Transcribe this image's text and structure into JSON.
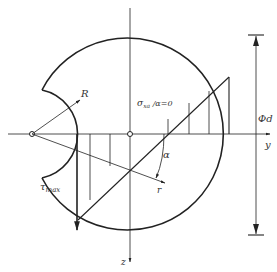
{
  "diagram": {
    "type": "stress distribution in circular cross-section with notch",
    "colors": {
      "line": "#222222",
      "text": "#333333",
      "background": "#ffffff"
    },
    "labels": {
      "R": "R",
      "sigma_label": "σ",
      "sigma_sub": "xa",
      "sigma_cond": " /α=0",
      "phi_d": "Φd",
      "y_axis": "y",
      "z_axis": "z",
      "alpha": "α",
      "r": "r",
      "tau": "τ",
      "tau_sub": "max"
    }
  }
}
